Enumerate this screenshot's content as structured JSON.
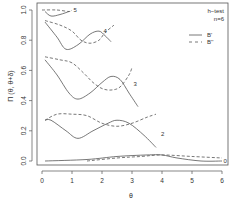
{
  "chart_data": {
    "type": "line",
    "title": "",
    "xlabel": "θ",
    "ylabel": "Π (θ, θ+δ)",
    "xlim": [
      0,
      6
    ],
    "ylim": [
      0,
      1.0
    ],
    "x_ticks": [
      0,
      1,
      2,
      3,
      4,
      5,
      6
    ],
    "y_ticks": [
      0.0,
      0.2,
      0.4,
      0.6,
      0.8,
      1.0
    ],
    "y_tick_labels": [
      "0.0",
      "0.2",
      "0.4",
      "0.6",
      "0.8",
      "1.0"
    ],
    "grid": false,
    "legend": {
      "position": "top-right",
      "title_lines": [
        "h−test",
        "n=6"
      ],
      "entries": [
        {
          "label": "B'",
          "style": "solid"
        },
        {
          "label": "B''",
          "style": "dashed"
        }
      ]
    },
    "series": [
      {
        "name": "5 B'",
        "group": "5",
        "style": "solid",
        "x": [
          0.1,
          0.3,
          0.6,
          0.9
        ],
        "y": [
          0.99,
          0.96,
          0.97,
          0.99
        ]
      },
      {
        "name": "5 B''",
        "group": "5",
        "style": "dashed",
        "x": [
          0.0,
          0.5,
          0.9,
          1.0
        ],
        "y": [
          1.0,
          1.0,
          0.99,
          1.0
        ]
      },
      {
        "name": "4 B'",
        "group": "4",
        "style": "solid",
        "x": [
          0.1,
          0.5,
          0.8,
          1.2,
          1.6,
          1.9,
          2.1,
          2.3
        ],
        "y": [
          0.92,
          0.82,
          0.74,
          0.77,
          0.84,
          0.86,
          0.83,
          0.79
        ]
      },
      {
        "name": "4 B''",
        "group": "4",
        "style": "dashed",
        "x": [
          0.1,
          0.6,
          1.0,
          1.3,
          1.6,
          1.9,
          2.1,
          2.4
        ],
        "y": [
          0.93,
          0.9,
          0.86,
          0.8,
          0.78,
          0.8,
          0.85,
          0.9
        ]
      },
      {
        "name": "3 B'",
        "group": "3",
        "style": "solid",
        "x": [
          0.1,
          0.5,
          0.9,
          1.2,
          1.6,
          2.0,
          2.3,
          2.6,
          2.9,
          3.2
        ],
        "y": [
          0.67,
          0.57,
          0.45,
          0.41,
          0.45,
          0.52,
          0.56,
          0.54,
          0.45,
          0.36
        ]
      },
      {
        "name": "3 B''",
        "group": "3",
        "style": "dashed",
        "x": [
          0.1,
          0.6,
          1.0,
          1.4,
          1.7,
          2.0,
          2.3,
          2.6,
          2.9,
          3.0
        ],
        "y": [
          0.69,
          0.67,
          0.65,
          0.58,
          0.52,
          0.48,
          0.47,
          0.49,
          0.57,
          0.62
        ]
      },
      {
        "name": "2 B'",
        "group": "2",
        "style": "solid",
        "x": [
          0.1,
          0.3,
          0.8,
          1.2,
          1.7,
          2.2,
          2.5,
          2.9,
          3.4,
          3.8
        ],
        "y": [
          0.27,
          0.27,
          0.2,
          0.15,
          0.2,
          0.25,
          0.27,
          0.25,
          0.17,
          0.09
        ]
      },
      {
        "name": "2 B''",
        "group": "2",
        "style": "dashed",
        "x": [
          0.1,
          0.5,
          1.0,
          1.5,
          2.0,
          2.5,
          3.0,
          3.5,
          3.8
        ],
        "y": [
          0.27,
          0.31,
          0.31,
          0.3,
          0.25,
          0.23,
          0.25,
          0.29,
          0.31
        ]
      },
      {
        "name": "0 B'",
        "group": "0",
        "style": "solid",
        "x": [
          0.1,
          1.5,
          2.5,
          3.5,
          4.0,
          4.5,
          5.3,
          6.0
        ],
        "y": [
          0.0,
          0.01,
          0.03,
          0.04,
          0.04,
          0.02,
          0.0,
          0.0
        ]
      },
      {
        "name": "0 B''",
        "group": "0",
        "style": "dashed",
        "x": [
          1.5,
          2.5,
          3.3,
          4.0,
          5.0,
          6.0
        ],
        "y": [
          0.0,
          0.02,
          0.03,
          0.04,
          0.03,
          0.02
        ]
      }
    ],
    "annotations": [
      {
        "text": "5",
        "x": 1.05,
        "y": 1.0
      },
      {
        "text": "4",
        "x": 2.05,
        "y": 0.86
      },
      {
        "text": "3",
        "x": 3.05,
        "y": 0.51
      },
      {
        "text": "2",
        "x": 3.97,
        "y": 0.18
      },
      {
        "text": "0",
        "x": 6.05,
        "y": 0.0
      }
    ]
  },
  "style": {
    "line_color": "#555555",
    "axis_color": "#555555",
    "text_color": "#333333"
  }
}
